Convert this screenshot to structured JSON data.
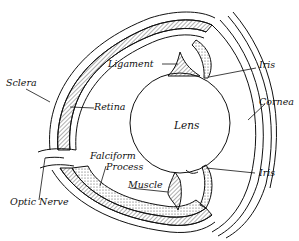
{
  "diagram": {
    "labels": {
      "sclera": "Sclera",
      "retina": "Retina",
      "ligament": "Ligament",
      "iris_top": "Iris",
      "cornea": "Cornea",
      "lens": "Lens",
      "falciform_1": "Falciform",
      "falciform_2": "Process",
      "muscle": "Muscle",
      "iris_bottom": "Iris",
      "optic_nerve": "Optic Nerve"
    },
    "colors": {
      "line": "#111111",
      "background": "#ffffff",
      "stipple": "#555555"
    }
  }
}
